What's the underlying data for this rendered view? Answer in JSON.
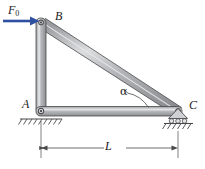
{
  "figure": {
    "type": "statics-free-body-diagram",
    "labels": {
      "joint_top": "B",
      "joint_bottom_left": "A",
      "joint_bottom_right": "C",
      "force": "F",
      "force_subscript": "0",
      "angle": "α",
      "dimension_span": "L"
    },
    "colors": {
      "force_arrow": "#2f4fa0",
      "member_fill": "#a8a9ad",
      "member_highlight": "#d8d9dc",
      "member_stroke": "#4a4a4c",
      "ground_line": "#4a4a4c",
      "dimension_line": "#4a4a4c",
      "label_text": "#1a1a1a"
    },
    "geometry": {
      "joint_B": [
        41,
        22
      ],
      "joint_A": [
        41,
        111
      ],
      "joint_C": [
        178,
        111
      ],
      "force_arrow_from": [
        3,
        21
      ],
      "force_arrow_to": [
        38,
        21
      ],
      "dimension_from": [
        41,
        148
      ],
      "dimension_to": [
        178,
        148
      ],
      "ground_level_A": 119,
      "ground_level_C": 125
    },
    "supports": {
      "A": "pin-support-hatched",
      "C": "roller-support-hatched"
    }
  }
}
